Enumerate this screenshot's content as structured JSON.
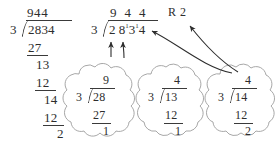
{
  "diagram": {
    "ink_color": "#2d2d2d",
    "cloud_outline_color": "#9a9a9a",
    "background": "#ffffff"
  },
  "long_division": {
    "label": "long-division",
    "quotient": "944",
    "divisor": "3",
    "dividend": "2834",
    "step1_subtrahend": "27",
    "step1_remainder": "13",
    "step2_subtrahend": "12",
    "step2_remainder": "14",
    "step3_subtrahend": "12",
    "final_remainder": "2"
  },
  "short_division": {
    "label": "short-division",
    "quotient": "9 4 4",
    "remainder_label": "R 2",
    "divisor": "3",
    "dividend_digit_1": "2",
    "dividend_digit_2": "8",
    "carry_1": "1",
    "dividend_digit_3": "3",
    "carry_2": "1",
    "dividend_digit_4": "4"
  },
  "clouds": [
    {
      "name": "cloud-step-1",
      "quotient": "9",
      "divisor": "3",
      "dividend": "28",
      "subtrahend": "27",
      "remainder": "1"
    },
    {
      "name": "cloud-step-2",
      "quotient": "4",
      "divisor": "3",
      "dividend": "13",
      "subtrahend": "12",
      "remainder": "1"
    },
    {
      "name": "cloud-step-3",
      "quotient": "4",
      "divisor": "3",
      "dividend": "14",
      "subtrahend": "12",
      "remainder": "2"
    }
  ],
  "arrows": {
    "carry_arrow_1": "arrow from cloud 1 remainder up to first carry mark",
    "carry_arrow_2": "arrow from cloud 2 remainder up to second carry mark",
    "remainder_arrow_1": "curved arrow from cloud 3 to dividend",
    "remainder_arrow_2": "curved arrow from cloud 3 to R 2"
  }
}
